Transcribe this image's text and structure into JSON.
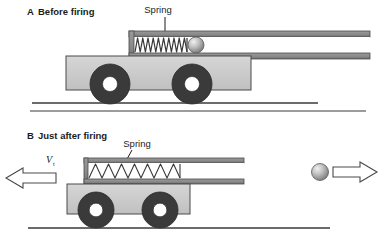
{
  "figure": {
    "background_color": "#ffffff"
  },
  "panels": [
    {
      "id": "panel-a",
      "letter": "A",
      "label": "A  Before firing",
      "letter_text": "A",
      "caption_text": "Before firing",
      "callout": {
        "label": "Spring",
        "leader": "vertical-line"
      },
      "ground": {
        "label": "ground-line"
      },
      "cart": {
        "body_color": "#c9c9c9",
        "body_outline": "#4a4a4a",
        "wheel_color": "#3a3a3a",
        "hub_color": "#ffffff"
      },
      "barrel": {
        "rail_color": "#8a8a8a",
        "rail_outline": "#4a4a4a",
        "interior_color": "#ffffff"
      },
      "spring": {
        "state": "compressed",
        "coils": 11,
        "color": "#3a3a3a"
      },
      "ball": {
        "state": "at-rest-in-barrel",
        "fill": "#b0b0b0",
        "highlight": "#e8e8e8"
      }
    },
    {
      "id": "panel-b",
      "letter": "B",
      "label": "B  Just after firing",
      "letter_text": "B",
      "caption_text": "Just after firing",
      "callout": {
        "label": "Spring",
        "leader": "diagonal-line"
      },
      "ground": {
        "label": "ground-line"
      },
      "cart": {
        "body_color": "#c9c9c9",
        "body_outline": "#4a4a4a",
        "wheel_color": "#3a3a3a",
        "hub_color": "#ffffff"
      },
      "barrel": {
        "rail_color": "#8a8a8a",
        "rail_outline": "#4a4a4a",
        "interior_color": "#ffffff"
      },
      "spring": {
        "state": "expanded",
        "coils": 9,
        "color": "#3a3a3a"
      },
      "ball": {
        "state": "fired-right",
        "fill": "#b0b0b0",
        "highlight": "#e8e8e8"
      },
      "arrows": [
        {
          "id": "cart-recoil-arrow",
          "direction": "left",
          "style": "hollow-outline",
          "label": "V",
          "label_subscript": "t"
        },
        {
          "id": "ball-velocity-arrow",
          "direction": "right",
          "style": "hollow-outline",
          "label": "",
          "label_subscript": ""
        }
      ]
    }
  ],
  "divider": {
    "label": "panel-divider",
    "color": "#3a3a3a"
  },
  "colors": {
    "ink": "#1b1b1b",
    "ground": "#3a3a3a",
    "cart_body": "#c9c9c9",
    "wheel": "#3a3a3a",
    "rail": "#8a8a8a",
    "outline": "#4a4a4a"
  }
}
